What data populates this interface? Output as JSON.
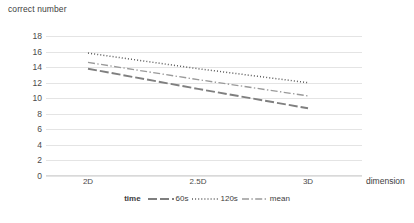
{
  "chart_data": {
    "type": "line",
    "title": "",
    "xlabel": "dimension",
    "ylabel": "correct number",
    "categories": [
      "2D",
      "2.5D",
      "3D"
    ],
    "xtick_labels": [
      "2D",
      "2.5D",
      "3D"
    ],
    "ytick_labels": [
      "0",
      "2",
      "4",
      "6",
      "8",
      "10",
      "12",
      "14",
      "16",
      "18"
    ],
    "ytick_values": [
      0,
      2,
      4,
      6,
      8,
      10,
      12,
      14,
      16,
      18
    ],
    "ylim": [
      0,
      18
    ],
    "grid": true,
    "legend_position": "bottom",
    "legend_title": "time",
    "series": [
      {
        "name": "60s",
        "values": [
          13.8,
          11.2,
          8.7
        ],
        "style": "dash-long",
        "color": "#7f7f7f"
      },
      {
        "name": "120s",
        "values": [
          15.8,
          13.8,
          12.0
        ],
        "style": "dotted",
        "color": "#5a5a5a"
      },
      {
        "name": "mean",
        "values": [
          14.6,
          12.4,
          10.3
        ],
        "style": "dash-dot",
        "color": "#9a9a9a"
      }
    ],
    "annotations": []
  },
  "legend": {
    "title": "time",
    "items": [
      {
        "label": "60s",
        "icon": "line-dash-long-icon"
      },
      {
        "label": "120s",
        "icon": "line-dotted-icon"
      },
      {
        "label": "mean",
        "icon": "line-dash-dot-icon"
      }
    ]
  },
  "colors": {
    "grid": "#e4e4e4",
    "axis": "#d9d9d9",
    "text": "#3d3d3d",
    "series_60s": "#7f7f7f",
    "series_120s": "#5a5a5a",
    "series_mean": "#9a9a9a"
  }
}
